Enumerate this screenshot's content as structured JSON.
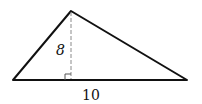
{
  "figure": {
    "type": "triangle",
    "vertices": {
      "apex": [
        71,
        11
      ],
      "base_left": [
        13,
        80
      ],
      "base_right": [
        187,
        80
      ]
    },
    "altitude": {
      "from": [
        71,
        11
      ],
      "to": [
        71,
        80
      ],
      "style": "dashed",
      "label": "8"
    },
    "base": {
      "label": "10"
    },
    "right_angle_marker": {
      "at": [
        71,
        80
      ],
      "size": 6,
      "side": "left"
    },
    "colors": {
      "edge": "#111111",
      "altitude": "#8a8a8a",
      "background": "#ffffff"
    }
  }
}
